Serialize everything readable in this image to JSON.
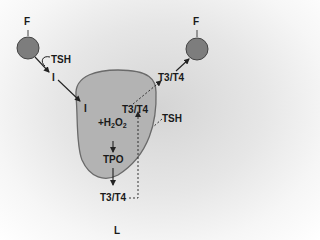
{
  "diagram": {
    "labels": {
      "follicle_left": "F",
      "follicle_right": "F",
      "tsh_top": "TSH",
      "iodide_outside": "I",
      "iodide_inside": "I",
      "h2o2_prefix": "+H",
      "h2o2_sub1": "2",
      "h2o2_mid": "O",
      "h2o2_sub2": "2",
      "tpo": "TPO",
      "t3t4_inside": "T3/T4",
      "t3t4_outside": "T3/T4",
      "tsh_right": "TSH",
      "t3t4_bottom": "T3/T4",
      "lumen": "L"
    },
    "colors": {
      "cell_fill": "#b3b3b3",
      "cell_stroke": "#6a6a6a",
      "circle_fill": "#7d7d7d",
      "circle_stroke": "#444444",
      "arrow": "#222222"
    }
  }
}
